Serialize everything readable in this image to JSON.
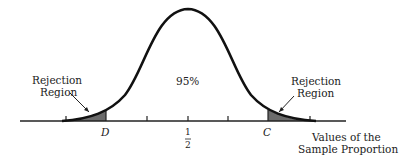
{
  "diagram": {
    "type": "normal-distribution-rejection-regions",
    "center_label_num": "1",
    "center_label_den": "2",
    "left_critical": "D",
    "right_critical": "C",
    "area_label": "95%",
    "left_region_label_1": "Rejection",
    "left_region_label_2": "Region",
    "right_region_label_1": "Rejection",
    "right_region_label_2": "Region",
    "axis_label_1": "Values of the",
    "axis_label_2": "Sample Proportion",
    "colors": {
      "curve": "#111111",
      "shade": "#6b6b6b",
      "axis": "#222222"
    }
  }
}
